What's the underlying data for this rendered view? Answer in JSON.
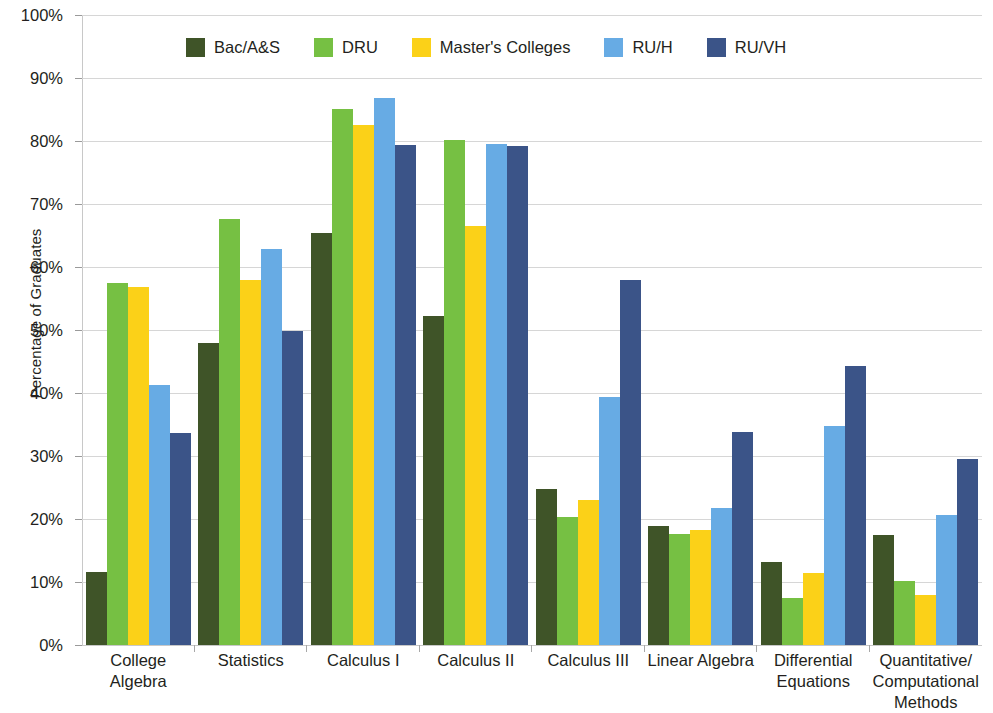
{
  "chart_data": {
    "type": "bar",
    "title": "",
    "xlabel": "",
    "ylabel": "Percentage of Graduates",
    "ylim": [
      0,
      100
    ],
    "ytick_labels": [
      "100%",
      "90%",
      "80%",
      "70%",
      "60%",
      "50%",
      "40%",
      "30%",
      "20%",
      "10%",
      "0%"
    ],
    "ytick_values": [
      100,
      90,
      80,
      70,
      60,
      50,
      40,
      30,
      20,
      10,
      0
    ],
    "grid": true,
    "legend_position": "top-center",
    "categories": [
      "College Algebra",
      "Statistics",
      "Calculus I",
      "Calculus II",
      "Calculus III",
      "Linear Algebra",
      "Differential Equations",
      "Quantitative/ Computational Methods"
    ],
    "series": [
      {
        "name": "Bac/A&S",
        "color": "#3f5428",
        "values": [
          11.6,
          48.0,
          65.4,
          52.2,
          24.8,
          18.9,
          13.1,
          17.5
        ]
      },
      {
        "name": "DRU",
        "color": "#76c043",
        "values": [
          57.5,
          67.6,
          85.1,
          80.2,
          20.3,
          17.6,
          7.5,
          10.1
        ]
      },
      {
        "name": "Master's Colleges",
        "color": "#fbd118",
        "values": [
          56.8,
          58.0,
          82.6,
          66.5,
          23.0,
          18.2,
          11.5,
          8.0
        ]
      },
      {
        "name": "RU/H",
        "color": "#67abe4",
        "values": [
          41.2,
          62.8,
          86.9,
          79.5,
          39.4,
          21.7,
          34.7,
          20.7
        ]
      },
      {
        "name": "RU/VH",
        "color": "#3b5488",
        "values": [
          33.7,
          49.8,
          79.3,
          79.2,
          58.0,
          33.8,
          44.3,
          29.6
        ]
      }
    ]
  }
}
